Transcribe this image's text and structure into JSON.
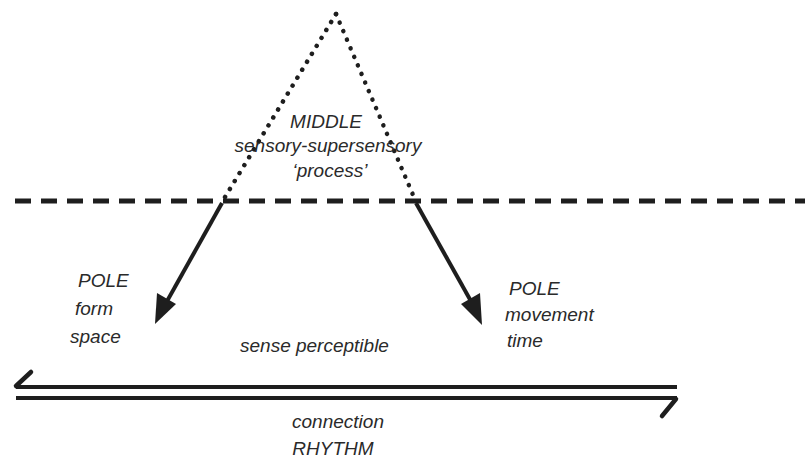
{
  "diagram": {
    "type": "conceptual-polarity-diagram",
    "colors": {
      "background": "#ffffff",
      "ink": "#1e1e1e",
      "text": "#2a2a2a"
    },
    "middle": {
      "title": "MIDDLE",
      "line1": "sensory-supersensory",
      "line2": "‘process’"
    },
    "left_pole": {
      "title": "POLE",
      "line1": "form",
      "line2": "space"
    },
    "right_pole": {
      "title": "POLE",
      "line1": "movement",
      "line2": "time"
    },
    "center_label": "sense perceptible",
    "connection": {
      "line1": "connection",
      "line2": "RHYTHM"
    },
    "shapes": {
      "triangle": {
        "apex": [
          336,
          14
        ],
        "left_base": [
          222,
          202
        ],
        "right_base": [
          416,
          202
        ],
        "style": "dotted"
      },
      "threshold_line": {
        "y": 201,
        "x_start": 15,
        "x_end": 805,
        "style": "dashed"
      },
      "arrow_left": {
        "from": [
          222,
          202
        ],
        "to": [
          155,
          323
        ]
      },
      "arrow_right": {
        "from": [
          416,
          202
        ],
        "to": [
          482,
          324
        ]
      },
      "double_arrow": {
        "x_start": 14,
        "x_end": 677,
        "y_top": 386,
        "y_bottom": 398
      }
    }
  }
}
